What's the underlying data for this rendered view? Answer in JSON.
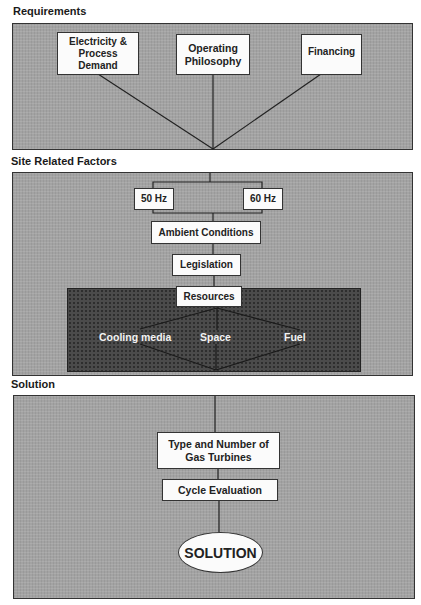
{
  "requirements": {
    "heading": "Requirements",
    "nodes": {
      "electricity": "Electricity & Process Demand",
      "operating": "Operating Philosophy",
      "financing": "Financing"
    }
  },
  "site_factors": {
    "heading": "Site Related Factors",
    "frequency_options": {
      "hz50": "50 Hz",
      "hz60": "60 Hz"
    },
    "ambient": "Ambient Conditions",
    "legislation": "Legislation",
    "resources": {
      "title": "Resources",
      "items": {
        "cooling": "Cooling media",
        "space": "Space",
        "fuel": "Fuel"
      }
    }
  },
  "solution": {
    "heading": "Solution",
    "gas_turbines": "Type and Number of Gas Turbines",
    "cycle": "Cycle Evaluation",
    "result": "SOLUTION"
  },
  "colors": {
    "panel_fill": "#a3a3a3",
    "resources_fill": "#4b4b4b",
    "node_fill": "#fbfbfb",
    "line": "#222222"
  }
}
